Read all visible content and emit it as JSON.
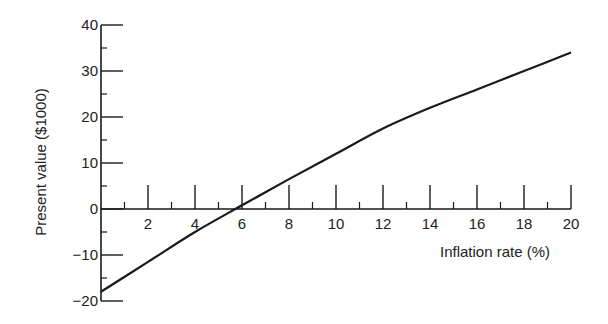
{
  "chart_data": {
    "type": "line",
    "title": "",
    "xlabel": "Inflation rate (%)",
    "ylabel": "Present value ($1000)",
    "xlim": [
      0,
      20
    ],
    "ylim": [
      -20,
      40
    ],
    "x_ticks": [
      2,
      4,
      6,
      8,
      10,
      12,
      14,
      16,
      18,
      20
    ],
    "y_ticks": [
      -20,
      -10,
      0,
      10,
      20,
      30,
      40
    ],
    "y_tick_labels": [
      "−20",
      "−10",
      "0",
      "10",
      "20",
      "30",
      "40"
    ],
    "grid": false,
    "legend": null,
    "series": [
      {
        "name": "Present value",
        "x": [
          0,
          2,
          4,
          6,
          8,
          10,
          12,
          14,
          16,
          18,
          20
        ],
        "values": [
          -18,
          -11.5,
          -5,
          0.8,
          6.5,
          12,
          17.5,
          22,
          26,
          30,
          34
        ]
      }
    ],
    "color": "#1a1a1a"
  }
}
